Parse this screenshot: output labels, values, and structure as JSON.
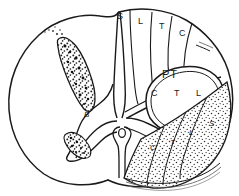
{
  "figure": {
    "stroke_color": "#1a1a1a",
    "fill_color": "#ffffff",
    "stipple_color": "#2b2b2b"
  },
  "dorsal_columns": {
    "name": "dorsal-columns",
    "labels": [
      {
        "text": "S",
        "x": 121,
        "y": 17
      },
      {
        "text": "L",
        "x": 142,
        "y": 22
      },
      {
        "text": "T",
        "x": 163,
        "y": 27
      },
      {
        "text": "C",
        "x": 183,
        "y": 34
      }
    ]
  },
  "pyramidal_tract": {
    "name": "pyramidal-tract",
    "abbrev": "PT",
    "abbrev_x": 168,
    "abbrev_y": 75,
    "sublabels": [
      {
        "text": "C",
        "x": 155,
        "y": 94
      },
      {
        "text": "T",
        "x": 178,
        "y": 94
      },
      {
        "text": "L",
        "x": 200,
        "y": 94
      }
    ]
  },
  "spinothalamic_tract": {
    "name": "spinothalamic-tract",
    "labels": [
      {
        "text": "C",
        "x": 153,
        "y": 148
      },
      {
        "text": "T",
        "x": 173,
        "y": 143
      },
      {
        "text": "L",
        "x": 192,
        "y": 133
      },
      {
        "text": "S",
        "x": 212,
        "y": 124
      }
    ]
  },
  "lateral_band": {
    "name": "lateral-degeneration-band",
    "labels": [
      {
        "text": "B",
        "x": 86,
        "y": 115
      }
    ]
  }
}
